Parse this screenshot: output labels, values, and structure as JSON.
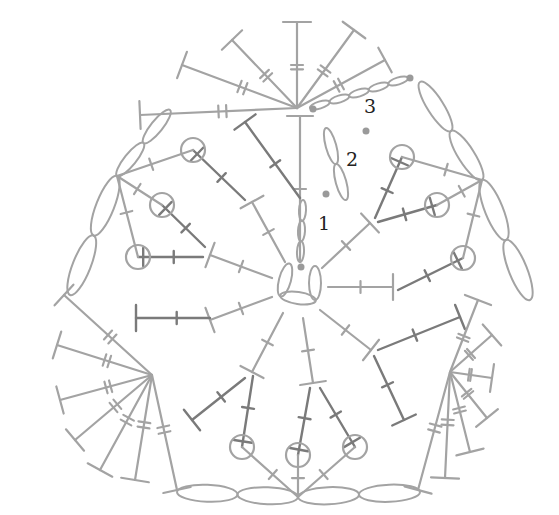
{
  "colors": {
    "light": "#a3a3a3",
    "dark": "#7a7a7a",
    "dot": "#9a9a9a",
    "label": "#222222",
    "background": "#ffffff"
  },
  "row_labels": [
    {
      "text": "1",
      "x": 318,
      "y": 230
    },
    {
      "text": "2",
      "x": 346,
      "y": 166
    },
    {
      "text": "3",
      "x": 364,
      "y": 113
    }
  ],
  "start_dots": [
    {
      "x": 301,
      "y": 267
    },
    {
      "x": 326,
      "y": 194
    },
    {
      "x": 366,
      "y": 131
    },
    {
      "x": 313,
      "y": 109
    },
    {
      "x": 410,
      "y": 78
    }
  ],
  "center": {
    "x": 298,
    "y": 283
  },
  "round1_dc": [
    {
      "from": [
        300,
        262
      ],
      "to": [
        300,
        116
      ],
      "style": "lt",
      "tick": true
    },
    {
      "from": [
        285,
        262
      ],
      "to": [
        252,
        202
      ],
      "style": "lt",
      "tick": true
    },
    {
      "from": [
        272,
        278
      ],
      "to": [
        210,
        255
      ],
      "style": "lt",
      "tick": true
    },
    {
      "from": [
        272,
        297
      ],
      "to": [
        210,
        320
      ],
      "style": "lt",
      "tick": true
    },
    {
      "from": [
        283,
        313
      ],
      "to": [
        252,
        372
      ],
      "style": "lt",
      "tick": true
    },
    {
      "from": [
        303,
        318
      ],
      "to": [
        313,
        383
      ],
      "style": "lt",
      "tick": true
    },
    {
      "from": [
        320,
        310
      ],
      "to": [
        371,
        350
      ],
      "style": "lt",
      "tick": true
    },
    {
      "from": [
        328,
        287
      ],
      "to": [
        393,
        287
      ],
      "style": "lt",
      "tick": true
    },
    {
      "from": [
        322,
        268
      ],
      "to": [
        370,
        223
      ],
      "style": "lt",
      "tick": true
    }
  ],
  "round2_stitches": [
    {
      "from": [
        300,
        198
      ],
      "to": [
        245,
        122
      ],
      "end": "T"
    },
    {
      "from": [
        245,
        200
      ],
      "to": [
        193,
        150
      ],
      "end": "puff"
    },
    {
      "from": [
        205,
        247
      ],
      "to": [
        162,
        205
      ],
      "end": "puff"
    },
    {
      "from": [
        203,
        257
      ],
      "to": [
        138,
        257
      ],
      "end": "puff"
    },
    {
      "from": [
        210,
        318
      ],
      "to": [
        136,
        318
      ],
      "end": "T"
    },
    {
      "from": [
        245,
        378
      ],
      "to": [
        192,
        420
      ],
      "end": "T"
    },
    {
      "from": [
        253,
        376
      ],
      "to": [
        242,
        447
      ],
      "end": "puff"
    },
    {
      "from": [
        310,
        388
      ],
      "to": [
        298,
        455
      ],
      "end": "puff"
    },
    {
      "from": [
        320,
        388
      ],
      "to": [
        355,
        447
      ],
      "end": "puff"
    },
    {
      "from": [
        374,
        356
      ],
      "to": [
        404,
        420
      ],
      "end": "T"
    },
    {
      "from": [
        378,
        350
      ],
      "to": [
        460,
        317
      ],
      "end": "T"
    },
    {
      "from": [
        398,
        290
      ],
      "to": [
        463,
        258
      ],
      "end": "puff"
    },
    {
      "from": [
        378,
        222
      ],
      "to": [
        437,
        205
      ],
      "end": "puff"
    },
    {
      "from": [
        375,
        218
      ],
      "to": [
        402,
        157
      ],
      "end": "puff"
    }
  ],
  "round3_fans": [
    {
      "name": "top",
      "origin": [
        297,
        108
      ],
      "ends": [
        [
          140,
          115
        ],
        [
          182,
          65
        ],
        [
          232,
          40
        ],
        [
          297,
          22
        ],
        [
          354,
          30
        ],
        [
          385,
          60
        ]
      ]
    },
    {
      "name": "left",
      "origin": [
        152,
        375
      ],
      "ends": [
        [
          64,
          295
        ],
        [
          57,
          345
        ],
        [
          60,
          400
        ],
        [
          75,
          440
        ],
        [
          100,
          470
        ],
        [
          135,
          480
        ],
        [
          177,
          490
        ]
      ]
    },
    {
      "name": "right",
      "origin": [
        450,
        372
      ],
      "ends": [
        [
          478,
          300
        ],
        [
          492,
          335
        ],
        [
          492,
          378
        ],
        [
          487,
          418
        ],
        [
          470,
          452
        ],
        [
          445,
          478
        ],
        [
          418,
          490
        ]
      ]
    },
    {
      "name": "bottom",
      "origin": [
        298,
        497
      ],
      "ends": []
    }
  ],
  "round3_sc": [
    {
      "from": [
        117,
        176
      ],
      "to": [
        193,
        150
      ]
    },
    {
      "from": [
        117,
        176
      ],
      "to": [
        162,
        205
      ]
    },
    {
      "from": [
        117,
        176
      ],
      "to": [
        138,
        257
      ]
    },
    {
      "from": [
        482,
        180
      ],
      "to": [
        402,
        157
      ]
    },
    {
      "from": [
        482,
        180
      ],
      "to": [
        437,
        205
      ]
    },
    {
      "from": [
        482,
        180
      ],
      "to": [
        463,
        258
      ]
    },
    {
      "from": [
        298,
        497
      ],
      "to": [
        242,
        447
      ]
    },
    {
      "from": [
        298,
        497
      ],
      "to": [
        298,
        455
      ]
    },
    {
      "from": [
        298,
        497
      ],
      "to": [
        355,
        447
      ]
    }
  ],
  "chains": [
    {
      "from": [
        310,
        108
      ],
      "to": [
        408,
        78
      ],
      "n": 5
    },
    {
      "from": [
        420,
        82
      ],
      "to": [
        482,
        180
      ],
      "n": 2
    },
    {
      "from": [
        482,
        180
      ],
      "to": [
        530,
        300
      ],
      "n": 2
    },
    {
      "from": [
        117,
        176
      ],
      "to": [
        170,
        110
      ],
      "n": 2
    },
    {
      "from": [
        117,
        176
      ],
      "to": [
        70,
        295
      ],
      "n": 2
    },
    {
      "from": [
        177,
        492
      ],
      "to": [
        298,
        497
      ],
      "n": 2
    },
    {
      "from": [
        298,
        497
      ],
      "to": [
        420,
        492
      ],
      "n": 2
    },
    {
      "from": [
        300,
        262
      ],
      "to": [
        303,
        200
      ],
      "n": 3
    },
    {
      "from": [
        326,
        128
      ],
      "to": [
        346,
        200
      ],
      "n": 2
    }
  ]
}
